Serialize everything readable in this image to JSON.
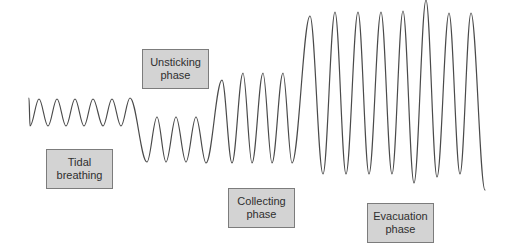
{
  "diagram": {
    "type": "waveform",
    "line_color": "#4a4a4a",
    "box_fill": "#d3d3d3",
    "box_border": "#7c7c7c",
    "text_color": "#2f2f2f",
    "phases": [
      {
        "id": "tidal",
        "label": "Tidal\nbreathing",
        "box": {
          "x": 46,
          "y": 149,
          "w": 67,
          "h": 40
        }
      },
      {
        "id": "unsticking",
        "label": "Unsticking\nphase",
        "box": {
          "x": 142,
          "y": 49,
          "w": 67,
          "h": 40
        }
      },
      {
        "id": "collecting",
        "label": "Collecting\nphase",
        "box": {
          "x": 228,
          "y": 188,
          "w": 67,
          "h": 40
        }
      },
      {
        "id": "evacuation",
        "label": "Evacuation\nphase",
        "box": {
          "x": 367,
          "y": 203,
          "w": 67,
          "h": 40
        }
      }
    ],
    "waveform_extrema": [
      [
        29,
        98
      ],
      [
        30,
        126
      ],
      [
        39,
        99
      ],
      [
        48,
        126
      ],
      [
        57,
        99
      ],
      [
        66,
        126
      ],
      [
        75,
        99
      ],
      [
        84,
        126
      ],
      [
        93,
        99
      ],
      [
        103,
        126
      ],
      [
        112,
        99
      ],
      [
        121,
        126
      ],
      [
        130,
        98
      ],
      [
        147,
        162
      ],
      [
        157,
        117
      ],
      [
        166,
        162
      ],
      [
        176,
        117
      ],
      [
        186,
        162
      ],
      [
        196,
        117
      ],
      [
        206,
        163
      ],
      [
        222,
        80
      ],
      [
        232,
        163
      ],
      [
        243,
        73
      ],
      [
        252,
        163
      ],
      [
        263,
        73
      ],
      [
        272,
        163
      ],
      [
        283,
        73
      ],
      [
        292,
        163
      ],
      [
        310,
        16
      ],
      [
        323,
        174
      ],
      [
        335,
        12
      ],
      [
        346,
        174
      ],
      [
        358,
        12
      ],
      [
        369,
        174
      ],
      [
        381,
        12
      ],
      [
        392,
        174
      ],
      [
        403,
        11
      ],
      [
        414,
        183
      ],
      [
        426,
        0
      ],
      [
        437,
        177
      ],
      [
        449,
        13
      ],
      [
        460,
        174
      ],
      [
        471,
        13
      ],
      [
        485,
        190
      ]
    ]
  }
}
